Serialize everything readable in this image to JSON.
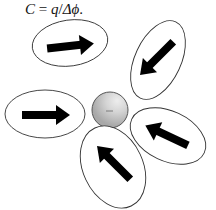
{
  "formula": {
    "lhs": "C",
    "eq": " = ",
    "num": "q",
    "slash": "/",
    "den": "Δϕ",
    "end": "."
  },
  "diagram": {
    "center_sphere": {
      "cx": 110,
      "cy": 110,
      "r": 18,
      "fill": "#b8b8b8",
      "highlight": "#e6e6e6",
      "stroke": "#555555",
      "sign": "−"
    },
    "dipoles": [
      {
        "name": "dipole-top-left",
        "cx": 70,
        "cy": 43,
        "rx": 38,
        "ry": 23,
        "rotate": -8,
        "arrow_direction": "right"
      },
      {
        "name": "dipole-top-right",
        "cx": 158,
        "cy": 60,
        "rx": 23,
        "ry": 42,
        "rotate": 25,
        "arrow_direction": "down-left"
      },
      {
        "name": "dipole-left",
        "cx": 45,
        "cy": 114,
        "rx": 40,
        "ry": 24,
        "rotate": 0,
        "arrow_direction": "right"
      },
      {
        "name": "dipole-right",
        "cx": 168,
        "cy": 136,
        "rx": 40,
        "ry": 25,
        "rotate": 25,
        "arrow_direction": "up-left"
      },
      {
        "name": "dipole-bottom",
        "cx": 113,
        "cy": 167,
        "rx": 30,
        "ry": 43,
        "rotate": -25,
        "arrow_direction": "up-left"
      }
    ],
    "colors": {
      "ellipse_stroke": "#333333",
      "arrow": "#000000"
    }
  }
}
